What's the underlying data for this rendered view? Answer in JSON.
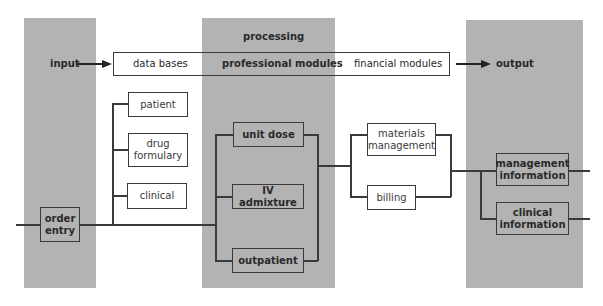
{
  "diagram": {
    "columns": {
      "input": {
        "label": "input"
      },
      "processing": {
        "label": "processing"
      },
      "output": {
        "label": "output"
      }
    },
    "top_bar": {
      "data_bases": "data bases",
      "professional_modules": "professional modules",
      "financial_modules": "financial modules"
    },
    "data_bases": {
      "patient": "patient",
      "drug_formulary_line1": "drug",
      "drug_formulary_line2": "formulary",
      "clinical": "clinical"
    },
    "order_entry": {
      "line1": "order",
      "line2": "entry"
    },
    "professional": {
      "unit_dose": "unit dose",
      "iv_admixture": "IV admixture",
      "outpatient": "outpatient"
    },
    "financial": {
      "materials_line1": "materials",
      "materials_line2": "management",
      "billing": "billing"
    },
    "outputs": {
      "management_line1": "management",
      "management_line2": "information",
      "clinical_line1": "clinical",
      "clinical_line2": "information"
    },
    "colors": {
      "column_gray": "#b3b3b3",
      "line": "#3a3a3a",
      "background": "#ffffff"
    }
  }
}
